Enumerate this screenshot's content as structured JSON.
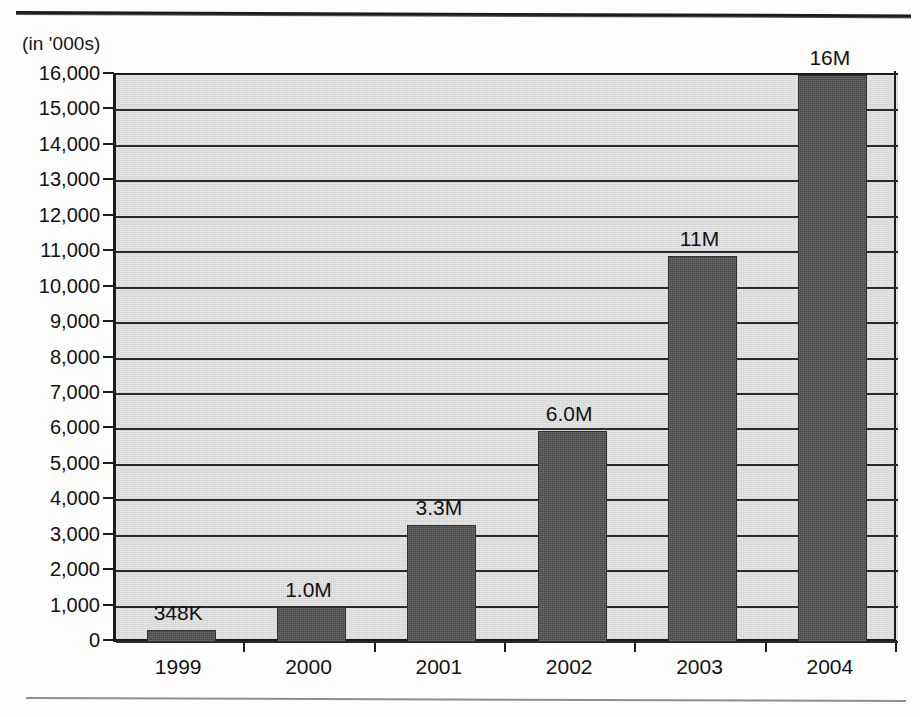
{
  "chart_data": {
    "type": "bar",
    "title": "",
    "subtitle": "",
    "xlabel": "",
    "ylabel": "(in '000s)",
    "unit_caption": "(in '000s)",
    "categories": [
      "1999",
      "2000",
      "2001",
      "2002",
      "2003",
      "2004"
    ],
    "values": [
      348,
      1000,
      3300,
      5950,
      10900,
      16000
    ],
    "data_labels": [
      "348K",
      "1.0M",
      "3.3M",
      "6.0M",
      "11M",
      "16M"
    ],
    "series": [
      {
        "name": "",
        "values": [
          348,
          1000,
          3300,
          5950,
          10900,
          16000
        ]
      }
    ],
    "ylim": [
      0,
      16000
    ],
    "ytick_values": [
      0,
      1000,
      2000,
      3000,
      4000,
      5000,
      6000,
      7000,
      8000,
      9000,
      10000,
      11000,
      12000,
      13000,
      14000,
      15000,
      16000
    ],
    "ytick_labels": [
      "0",
      "1,000",
      "2,000",
      "3,000",
      "4,000",
      "5,000",
      "6,000",
      "7,000",
      "8,000",
      "9,000",
      "10,000",
      "11,000",
      "12,000",
      "13,000",
      "14,000",
      "15,000",
      "16,000"
    ],
    "grid": true,
    "grid_axis": "y",
    "legend": false,
    "legend_position": "none",
    "annotations": [],
    "colors": {
      "bar_fill": "#4f4f4f",
      "bar_stroke": "#2e2e2e",
      "plot_background": "#d2d2d2",
      "gridline": "#2a2a2a",
      "axis": "#1c1c1c",
      "text": "#121212",
      "page_background": "#ffffff",
      "rule_top": "#1b1b1b",
      "rule_bottom": "#8e8e8e"
    }
  }
}
